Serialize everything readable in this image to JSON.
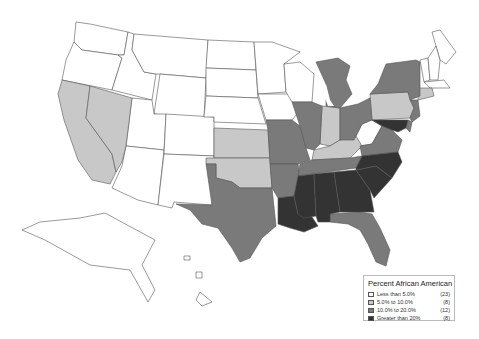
{
  "map": {
    "title": "Percent African American",
    "classes": [
      {
        "label": "Less than 5.0%",
        "count": "(23)",
        "color": "#ffffff"
      },
      {
        "label": "5.0% to 10.0%",
        "count": "(8)",
        "color": "#c8c8c8"
      },
      {
        "label": "10.0% to 20.0%",
        "count": "(12)",
        "color": "#7a7a7a"
      },
      {
        "label": "Greater than 20%",
        "count": "(8)",
        "color": "#333333"
      }
    ],
    "states": {
      "less_than_5": [
        "Washington",
        "Oregon",
        "Idaho",
        "Montana",
        "Wyoming",
        "Utah",
        "Arizona",
        "Colorado",
        "New Mexico",
        "North Dakota",
        "South Dakota",
        "Nebraska",
        "Minnesota",
        "Iowa",
        "Wisconsin",
        "West Virginia",
        "Maine",
        "Vermont",
        "New Hampshire",
        "Massachusetts",
        "Rhode Island",
        "Alaska",
        "Hawaii"
      ],
      "5_to_10": [
        "California",
        "Nevada",
        "Kansas",
        "Oklahoma",
        "Indiana",
        "Kentucky",
        "Pennsylvania",
        "Connecticut"
      ],
      "10_to_20": [
        "Texas",
        "Missouri",
        "Arkansas",
        "Tennessee",
        "Illinois",
        "Michigan",
        "Ohio",
        "New York",
        "New Jersey",
        "Virginia",
        "Delaware",
        "Florida"
      ],
      "greater_than_20": [
        "Louisiana",
        "Mississippi",
        "Alabama",
        "Georgia",
        "South Carolina",
        "North Carolina",
        "Maryland",
        "District of Columbia"
      ]
    }
  }
}
